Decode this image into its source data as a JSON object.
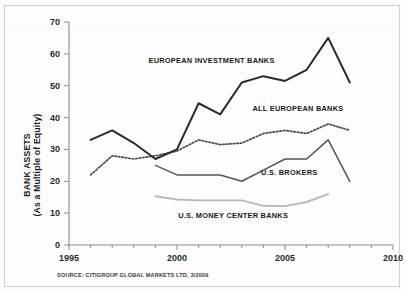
{
  "chart_data": {
    "type": "line",
    "title": "",
    "xlabel": "",
    "ylabel": "BANK ASSETS",
    "ylabel_sub": "(As a Multiple of Equity)",
    "xlim": [
      1995,
      2010
    ],
    "ylim": [
      0,
      70
    ],
    "y_ticks": [
      0,
      10,
      20,
      30,
      40,
      50,
      60,
      70
    ],
    "x_ticks": [
      1995,
      2000,
      2005,
      2010
    ],
    "x_minor_tick_step": 1,
    "grid": false,
    "legend_position": "inline-annotations",
    "source_note": "SOURCE: CITIGROUP GLOBAL MARKETS LTD, 3/2009",
    "series": [
      {
        "name": "EUROPEAN INVESTMENT BANKS",
        "style": "solid-thick-dark",
        "color": "#2a2a2a",
        "x": [
          1996,
          1997,
          1998,
          1999,
          2000,
          2001,
          2002,
          2003,
          2004,
          2005,
          2006,
          2007,
          2008
        ],
        "values": [
          33,
          36,
          32,
          27,
          30,
          44.5,
          41,
          51,
          53,
          51.5,
          55,
          65,
          51
        ]
      },
      {
        "name": "ALL EUROPEAN BANKS",
        "style": "dotted",
        "color": "#4a4a4a",
        "x": [
          1996,
          1997,
          1998,
          1999,
          2000,
          2001,
          2002,
          2003,
          2004,
          2005,
          2006,
          2007,
          2008
        ],
        "values": [
          22,
          28,
          27,
          28,
          29.5,
          33,
          31.5,
          32,
          35,
          36,
          35,
          38,
          36
        ]
      },
      {
        "name": "U.S. BROKERS",
        "style": "solid-medium",
        "color": "#555555",
        "x": [
          1999,
          2000,
          2001,
          2002,
          2003,
          2004,
          2005,
          2006,
          2007,
          2008
        ],
        "values": [
          25,
          22,
          22,
          22,
          20,
          23.5,
          27,
          27,
          33,
          20
        ]
      },
      {
        "name": "U.S. MONEY CENTER BANKS",
        "style": "solid-light-gray",
        "color": "#b9b9b9",
        "x": [
          1999,
          2000,
          2001,
          2002,
          2003,
          2004,
          2005,
          2006,
          2007
        ],
        "values": [
          15.3,
          14.3,
          14,
          14,
          14,
          12.3,
          12.2,
          13.5,
          16
        ]
      }
    ],
    "annotations": [
      {
        "text": "EUROPEAN INVESTMENT BANKS",
        "x": 2001.6,
        "y": 57
      },
      {
        "text": "ALL EUROPEAN BANKS",
        "x": 2005.6,
        "y": 42
      },
      {
        "text": "U.S. BROKERS",
        "x": 2005.2,
        "y": 22
      },
      {
        "text": "U.S. MONEY CENTER BANKS",
        "x": 2002.6,
        "y": 8.6
      }
    ]
  },
  "colors": {
    "european_investment_banks": "#2a2a2a",
    "all_european_banks": "#4a4a4a",
    "us_brokers": "#555555",
    "us_money_center_banks": "#b9b9b9",
    "axis": "#8a8a8a",
    "frame": "#cfcfcf"
  },
  "axis": {
    "y_tick_labels": [
      "0",
      "10",
      "20",
      "30",
      "40",
      "50",
      "60",
      "70"
    ],
    "x_tick_labels": [
      "1995",
      "2000",
      "2005",
      "2010"
    ]
  }
}
